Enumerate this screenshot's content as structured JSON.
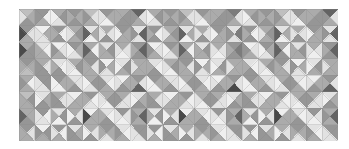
{
  "image": {
    "title": "Triangle Quilt Pattern",
    "width": 349,
    "height": 149,
    "background_color": "#ffffff"
  },
  "chart_data": {
    "type": "heatmap",
    "subtitle": "",
    "xlabel": "",
    "ylabel": "",
    "grid": true,
    "legend": "none",
    "columns": 20,
    "rows": 8,
    "cell_width": 15.95,
    "cell_height": 16.5,
    "origin_x": 19,
    "origin_y": 9,
    "grid_line_color": "#8a8a8a",
    "grid_line_width": 0.5,
    "palette": {
      "k0": "#2f2f2f",
      "k1": "#4a4a4a",
      "k2": "#636363",
      "k3": "#7c7c7c",
      "k4": "#969696",
      "k5": "#ababab",
      "k6": "#bfbfbf",
      "k7": "#d2d2d2",
      "k8": "#e2e2e2",
      "k9": "#efefef"
    },
    "triangle_order": [
      "top",
      "right",
      "bottom",
      "left"
    ],
    "cells": [
      [
        [
          "k6",
          "k5",
          "k4",
          "k8"
        ],
        [
          "k4",
          "k9",
          "k5",
          "k4"
        ],
        [
          "k5",
          "k4",
          "k8",
          "k9"
        ],
        [
          "k4",
          "k5",
          "k4",
          "k5"
        ],
        [
          "k6",
          "k8",
          "k5",
          "k4"
        ],
        [
          "k4",
          "k5",
          "k9",
          "k8"
        ],
        [
          "k5",
          "k4",
          "k4",
          "k5"
        ],
        [
          "k2",
          "k8",
          "k5",
          "k4"
        ],
        [
          "k5",
          "k4",
          "k8",
          "k9"
        ],
        [
          "k4",
          "k5",
          "k4",
          "k5"
        ],
        [
          "k6",
          "k8",
          "k5",
          "k4"
        ],
        [
          "k4",
          "k5",
          "k9",
          "k8"
        ],
        [
          "k5",
          "k4",
          "k4",
          "k5"
        ],
        [
          "k3",
          "k8",
          "k5",
          "k4"
        ],
        [
          "k5",
          "k4",
          "k8",
          "k9"
        ],
        [
          "k4",
          "k5",
          "k4",
          "k5"
        ],
        [
          "k6",
          "k8",
          "k5",
          "k4"
        ],
        [
          "k4",
          "k5",
          "k9",
          "k8"
        ],
        [
          "k5",
          "k4",
          "k4",
          "k5"
        ],
        [
          "k2",
          "k8",
          "k5",
          "k4"
        ]
      ],
      [
        [
          "k4",
          "k8",
          "k5",
          "k1"
        ],
        [
          "k9",
          "k5",
          "k8",
          "k8"
        ],
        [
          "k4",
          "k9",
          "k4",
          "k5"
        ],
        [
          "k5",
          "k4",
          "k5",
          "k8"
        ],
        [
          "k8",
          "k5",
          "k9",
          "k2"
        ],
        [
          "k5",
          "k8",
          "k4",
          "k8"
        ],
        [
          "k4",
          "k5",
          "k5",
          "k9"
        ],
        [
          "k8",
          "k2",
          "k8",
          "k4"
        ],
        [
          "k4",
          "k9",
          "k4",
          "k5"
        ],
        [
          "k5",
          "k4",
          "k5",
          "k8"
        ],
        [
          "k8",
          "k5",
          "k9",
          "k2"
        ],
        [
          "k5",
          "k8",
          "k4",
          "k8"
        ],
        [
          "k4",
          "k5",
          "k5",
          "k9"
        ],
        [
          "k8",
          "k3",
          "k8",
          "k4"
        ],
        [
          "k4",
          "k9",
          "k4",
          "k5"
        ],
        [
          "k5",
          "k4",
          "k5",
          "k8"
        ],
        [
          "k8",
          "k5",
          "k9",
          "k2"
        ],
        [
          "k5",
          "k8",
          "k4",
          "k8"
        ],
        [
          "k4",
          "k5",
          "k5",
          "k9"
        ],
        [
          "k8",
          "k2",
          "k8",
          "k4"
        ]
      ],
      [
        [
          "k5",
          "k4",
          "k4",
          "k1"
        ],
        [
          "k8",
          "k9",
          "k5",
          "k5"
        ],
        [
          "k9",
          "k8",
          "k5",
          "k4"
        ],
        [
          "k4",
          "k5",
          "k8",
          "k9"
        ],
        [
          "k5",
          "k9",
          "k4",
          "k2"
        ],
        [
          "k8",
          "k4",
          "k5",
          "k5"
        ],
        [
          "k5",
          "k8",
          "k9",
          "k8"
        ],
        [
          "k4",
          "k2",
          "k4",
          "k5"
        ],
        [
          "k9",
          "k8",
          "k5",
          "k4"
        ],
        [
          "k4",
          "k5",
          "k8",
          "k9"
        ],
        [
          "k5",
          "k9",
          "k4",
          "k2"
        ],
        [
          "k8",
          "k4",
          "k5",
          "k5"
        ],
        [
          "k5",
          "k8",
          "k9",
          "k8"
        ],
        [
          "k4",
          "k3",
          "k4",
          "k5"
        ],
        [
          "k9",
          "k8",
          "k5",
          "k4"
        ],
        [
          "k4",
          "k5",
          "k8",
          "k9"
        ],
        [
          "k5",
          "k9",
          "k4",
          "k2"
        ],
        [
          "k8",
          "k4",
          "k5",
          "k5"
        ],
        [
          "k5",
          "k8",
          "k9",
          "k8"
        ],
        [
          "k4",
          "k2",
          "k4",
          "k5"
        ]
      ],
      [
        [
          "k4",
          "k5",
          "k6",
          "k5"
        ],
        [
          "k5",
          "k8",
          "k4",
          "k4"
        ],
        [
          "k8",
          "k9",
          "k4",
          "k5"
        ],
        [
          "k5",
          "k4",
          "k9",
          "k8"
        ],
        [
          "k4",
          "k8",
          "k5",
          "k5"
        ],
        [
          "k9",
          "k5",
          "k8",
          "k4"
        ],
        [
          "k8",
          "k4",
          "k5",
          "k9"
        ],
        [
          "k5",
          "k5",
          "k5",
          "k8"
        ],
        [
          "k8",
          "k9",
          "k4",
          "k5"
        ],
        [
          "k5",
          "k4",
          "k9",
          "k8"
        ],
        [
          "k4",
          "k8",
          "k5",
          "k5"
        ],
        [
          "k9",
          "k5",
          "k8",
          "k4"
        ],
        [
          "k8",
          "k4",
          "k5",
          "k9"
        ],
        [
          "k5",
          "k5",
          "k5",
          "k8"
        ],
        [
          "k8",
          "k9",
          "k4",
          "k5"
        ],
        [
          "k5",
          "k4",
          "k9",
          "k8"
        ],
        [
          "k4",
          "k8",
          "k5",
          "k5"
        ],
        [
          "k9",
          "k5",
          "k8",
          "k4"
        ],
        [
          "k8",
          "k4",
          "k5",
          "k9"
        ],
        [
          "k5",
          "k5",
          "k5",
          "k8"
        ]
      ],
      [
        [
          "k5",
          "k9",
          "k5",
          "k4"
        ],
        [
          "k4",
          "k4",
          "k8",
          "k8"
        ],
        [
          "k4",
          "k5",
          "k9",
          "k9"
        ],
        [
          "k8",
          "k8",
          "k4",
          "k5"
        ],
        [
          "k5",
          "k4",
          "k8",
          "k9"
        ],
        [
          "k8",
          "k9",
          "k5",
          "k4"
        ],
        [
          "k9",
          "k5",
          "k4",
          "k8"
        ],
        [
          "k4",
          "k8",
          "k2",
          "k5"
        ],
        [
          "k4",
          "k5",
          "k9",
          "k9"
        ],
        [
          "k8",
          "k8",
          "k4",
          "k5"
        ],
        [
          "k5",
          "k4",
          "k8",
          "k9"
        ],
        [
          "k8",
          "k9",
          "k5",
          "k4"
        ],
        [
          "k9",
          "k5",
          "k4",
          "k8"
        ],
        [
          "k4",
          "k8",
          "k1",
          "k5"
        ],
        [
          "k4",
          "k5",
          "k9",
          "k9"
        ],
        [
          "k8",
          "k8",
          "k4",
          "k5"
        ],
        [
          "k5",
          "k4",
          "k8",
          "k9"
        ],
        [
          "k8",
          "k9",
          "k5",
          "k4"
        ],
        [
          "k9",
          "k5",
          "k4",
          "k8"
        ],
        [
          "k4",
          "k8",
          "k2",
          "k5"
        ]
      ],
      [
        [
          "k6",
          "k4",
          "k5",
          "k5"
        ],
        [
          "k8",
          "k5",
          "k4",
          "k9"
        ],
        [
          "k5",
          "k8",
          "k4",
          "k4"
        ],
        [
          "k9",
          "k5",
          "k5",
          "k8"
        ],
        [
          "k4",
          "k9",
          "k8",
          "k5"
        ],
        [
          "k5",
          "k4",
          "k9",
          "k8"
        ],
        [
          "k5",
          "k8",
          "k8",
          "k4"
        ],
        [
          "k8",
          "k5",
          "k4",
          "k9"
        ],
        [
          "k5",
          "k8",
          "k4",
          "k4"
        ],
        [
          "k9",
          "k5",
          "k5",
          "k8"
        ],
        [
          "k4",
          "k9",
          "k8",
          "k5"
        ],
        [
          "k5",
          "k4",
          "k9",
          "k8"
        ],
        [
          "k5",
          "k8",
          "k8",
          "k4"
        ],
        [
          "k8",
          "k5",
          "k4",
          "k9"
        ],
        [
          "k5",
          "k8",
          "k4",
          "k4"
        ],
        [
          "k9",
          "k5",
          "k5",
          "k8"
        ],
        [
          "k4",
          "k9",
          "k8",
          "k5"
        ],
        [
          "k5",
          "k4",
          "k9",
          "k8"
        ],
        [
          "k5",
          "k8",
          "k8",
          "k4"
        ],
        [
          "k8",
          "k5",
          "k4",
          "k9"
        ]
      ],
      [
        [
          "k5",
          "k5",
          "k4",
          "k2"
        ],
        [
          "k4",
          "k9",
          "k8",
          "k8"
        ],
        [
          "k8",
          "k4",
          "k9",
          "k5"
        ],
        [
          "k5",
          "k8",
          "k4",
          "k9"
        ],
        [
          "k9",
          "k5",
          "k5",
          "k1"
        ],
        [
          "k8",
          "k9",
          "k4",
          "k5"
        ],
        [
          "k4",
          "k8",
          "k9",
          "k8"
        ],
        [
          "k5",
          "k2",
          "k5",
          "k4"
        ],
        [
          "k8",
          "k4",
          "k9",
          "k5"
        ],
        [
          "k5",
          "k8",
          "k4",
          "k9"
        ],
        [
          "k9",
          "k5",
          "k5",
          "k1"
        ],
        [
          "k8",
          "k9",
          "k4",
          "k5"
        ],
        [
          "k4",
          "k8",
          "k9",
          "k8"
        ],
        [
          "k5",
          "k2",
          "k5",
          "k4"
        ],
        [
          "k8",
          "k4",
          "k9",
          "k5"
        ],
        [
          "k5",
          "k8",
          "k4",
          "k9"
        ],
        [
          "k9",
          "k5",
          "k5",
          "k1"
        ],
        [
          "k8",
          "k9",
          "k4",
          "k5"
        ],
        [
          "k4",
          "k8",
          "k9",
          "k8"
        ],
        [
          "k5",
          "k2",
          "k5",
          "k4"
        ]
      ],
      [
        [
          "k4",
          "k8",
          "k5",
          "k5"
        ],
        [
          "k9",
          "k4",
          "k5",
          "k4"
        ],
        [
          "k4",
          "k9",
          "k5",
          "k8"
        ],
        [
          "k8",
          "k5",
          "k4",
          "k4"
        ],
        [
          "k5",
          "k8",
          "k4",
          "k9"
        ],
        [
          "k4",
          "k5",
          "k8",
          "k5"
        ],
        [
          "k8",
          "k9",
          "k5",
          "k4"
        ],
        [
          "k4",
          "k4",
          "k8",
          "k8"
        ],
        [
          "k4",
          "k9",
          "k5",
          "k8"
        ],
        [
          "k8",
          "k5",
          "k4",
          "k4"
        ],
        [
          "k5",
          "k8",
          "k4",
          "k9"
        ],
        [
          "k4",
          "k5",
          "k8",
          "k5"
        ],
        [
          "k8",
          "k9",
          "k5",
          "k4"
        ],
        [
          "k4",
          "k4",
          "k8",
          "k8"
        ],
        [
          "k4",
          "k9",
          "k5",
          "k8"
        ],
        [
          "k8",
          "k5",
          "k4",
          "k4"
        ],
        [
          "k5",
          "k8",
          "k4",
          "k9"
        ],
        [
          "k4",
          "k5",
          "k8",
          "k5"
        ],
        [
          "k8",
          "k9",
          "k5",
          "k4"
        ],
        [
          "k4",
          "k4",
          "k8",
          "k8"
        ]
      ]
    ]
  }
}
